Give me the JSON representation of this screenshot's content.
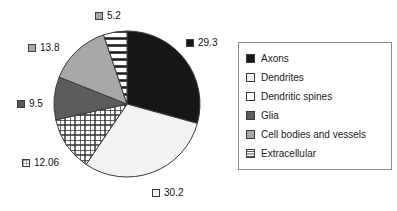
{
  "chart_data": {
    "type": "pie",
    "title": "",
    "labels": [
      "Axons",
      "Dendrites",
      "Dendritic spines",
      "Glia",
      "Cell bodies and vessels",
      "Extracellular"
    ],
    "values": [
      29.3,
      30.2,
      12.06,
      9.5,
      13.8,
      5.2
    ],
    "value_labels": [
      "29.3",
      "30.2",
      "12.06",
      "9.5",
      "13.8",
      "5.2"
    ],
    "total": 100.06,
    "start_angle_deg": 0,
    "direction": "clockwise",
    "legend_position": "right",
    "grid": false,
    "slices": [
      {
        "label": "Axons",
        "value": 29.3,
        "value_label": "29.3",
        "fill": "solid-black",
        "color": "#171717"
      },
      {
        "label": "Dendrites",
        "value": 30.2,
        "value_label": "30.2",
        "fill": "near-white",
        "color": "#f2f2f2"
      },
      {
        "label": "Dendritic spines",
        "value": 12.06,
        "value_label": "12.06",
        "fill": "grid",
        "color": "#ffffff"
      },
      {
        "label": "Glia",
        "value": 9.5,
        "value_label": "9.5",
        "fill": "dark-gray",
        "color": "#5c5c5c"
      },
      {
        "label": "Cell bodies and vessels",
        "value": 13.8,
        "value_label": "13.8",
        "fill": "mid-gray",
        "color": "#a8a8a8"
      },
      {
        "label": "Extracellular",
        "value": 5.2,
        "value_label": "5.2",
        "fill": "hlines",
        "color": "#ffffff"
      }
    ]
  },
  "legend": {
    "items": [
      {
        "label": "Axons",
        "fill": "solid-black"
      },
      {
        "label": "Dendrites",
        "fill": "near-white"
      },
      {
        "label": "Dendritic spines",
        "fill": "grid"
      },
      {
        "label": "Glia",
        "fill": "dark-gray"
      },
      {
        "label": "Cell bodies and vessels",
        "fill": "mid-gray"
      },
      {
        "label": "Extracellular",
        "fill": "hlines"
      }
    ]
  },
  "colors": {
    "axons": "#171717",
    "dendrites": "#f2f2f2",
    "dendritic_spines": "#ffffff",
    "glia": "#5c5c5c",
    "cell_bodies_and_vessels": "#a8a8a8",
    "extracellular": "#ffffff",
    "outline": "#3a3a3a",
    "legend_border": "#8d8d8d",
    "background": "#ffffff"
  }
}
